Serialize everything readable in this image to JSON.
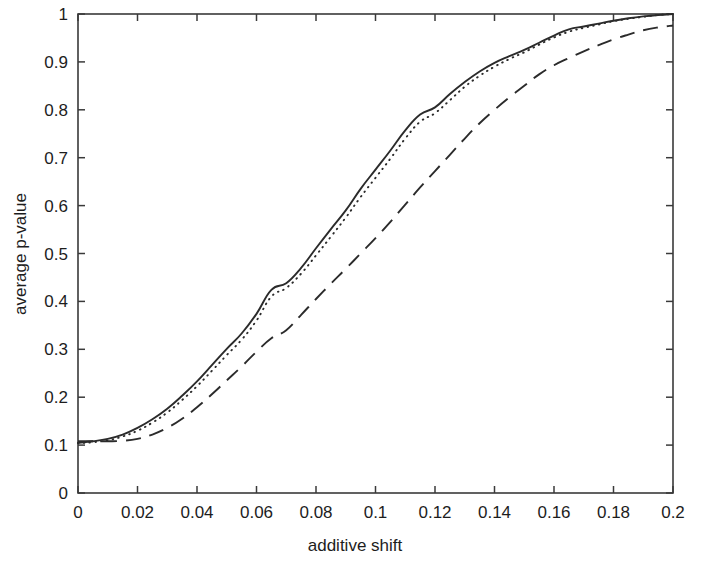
{
  "chart_data": {
    "type": "line",
    "title": "",
    "xlabel": "additive shift",
    "ylabel": "average p-value",
    "xlim": [
      0,
      0.2
    ],
    "ylim": [
      0,
      1
    ],
    "grid": false,
    "legend": "none",
    "xticks": [
      0,
      0.02,
      0.04,
      0.06,
      0.08,
      0.1,
      0.12,
      0.14,
      0.16,
      0.18,
      0.2
    ],
    "xticklabels": [
      "0",
      "0.02",
      "0.04",
      "0.06",
      "0.08",
      "0.1",
      "0.12",
      "0.14",
      "0.16",
      "0.18",
      "0.2"
    ],
    "yticks": [
      0,
      0.1,
      0.2,
      0.3,
      0.4,
      0.5,
      0.6,
      0.7,
      0.8,
      0.9,
      1
    ],
    "yticklabels": [
      "0",
      "0.1",
      "0.2",
      "0.3",
      "0.4",
      "0.5",
      "0.6",
      "0.7",
      "0.8",
      "0.9",
      "1"
    ],
    "x": [
      0,
      0.005,
      0.01,
      0.015,
      0.02,
      0.025,
      0.03,
      0.035,
      0.04,
      0.045,
      0.05,
      0.055,
      0.06,
      0.065,
      0.07,
      0.075,
      0.08,
      0.085,
      0.09,
      0.095,
      0.1,
      0.105,
      0.11,
      0.115,
      0.12,
      0.125,
      0.13,
      0.135,
      0.14,
      0.145,
      0.15,
      0.155,
      0.16,
      0.165,
      0.17,
      0.175,
      0.18,
      0.185,
      0.19,
      0.195,
      0.2
    ],
    "series": [
      {
        "name": "solid",
        "style": "solid",
        "color": "#2b2b2b",
        "values": [
          0.105,
          0.108,
          0.113,
          0.122,
          0.136,
          0.154,
          0.176,
          0.203,
          0.233,
          0.267,
          0.301,
          0.333,
          0.374,
          0.424,
          0.438,
          0.47,
          0.511,
          0.551,
          0.59,
          0.635,
          0.675,
          0.715,
          0.757,
          0.79,
          0.805,
          0.833,
          0.858,
          0.88,
          0.898,
          0.912,
          0.925,
          0.94,
          0.955,
          0.968,
          0.974,
          0.98,
          0.986,
          0.991,
          0.995,
          0.998,
          1.0
        ]
      },
      {
        "name": "dotted",
        "style": "dotted",
        "color": "#2b2b2b",
        "values": [
          0.104,
          0.106,
          0.11,
          0.118,
          0.13,
          0.147,
          0.168,
          0.194,
          0.223,
          0.255,
          0.288,
          0.32,
          0.36,
          0.41,
          0.428,
          0.458,
          0.496,
          0.535,
          0.575,
          0.618,
          0.658,
          0.698,
          0.74,
          0.775,
          0.793,
          0.82,
          0.848,
          0.871,
          0.89,
          0.906,
          0.92,
          0.936,
          0.951,
          0.963,
          0.971,
          0.978,
          0.985,
          0.99,
          0.994,
          0.998,
          1.0
        ]
      },
      {
        "name": "dashed",
        "style": "dashed",
        "color": "#2b2b2b",
        "values": [
          0.108,
          0.108,
          0.108,
          0.109,
          0.113,
          0.122,
          0.136,
          0.155,
          0.179,
          0.206,
          0.235,
          0.264,
          0.295,
          0.323,
          0.34,
          0.372,
          0.405,
          0.437,
          0.468,
          0.5,
          0.532,
          0.566,
          0.602,
          0.638,
          0.672,
          0.706,
          0.74,
          0.772,
          0.8,
          0.826,
          0.85,
          0.874,
          0.893,
          0.908,
          0.922,
          0.935,
          0.947,
          0.957,
          0.966,
          0.972,
          0.976
        ]
      }
    ]
  },
  "axis": {
    "x_title": "additive shift",
    "y_title": "average p-value"
  }
}
